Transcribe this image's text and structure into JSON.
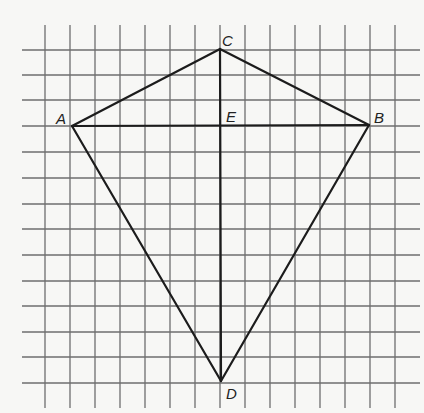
{
  "figure": {
    "colors": {
      "background": "#f7f7f5",
      "grid": "#6e6e6e",
      "lines": "#1c1c1c"
    },
    "grid": {
      "vertical_x": [
        45,
        70,
        95,
        120,
        145,
        170,
        195,
        220,
        245,
        270,
        295,
        320,
        345,
        370,
        395
      ],
      "vertical_y_range": [
        25,
        408
      ],
      "horizontal_y": [
        50,
        75,
        100,
        126,
        152,
        178,
        204,
        229,
        255,
        281,
        306,
        332,
        357,
        383
      ],
      "horizontal_x_range": [
        22,
        420
      ]
    },
    "points": {
      "A": {
        "x": 72,
        "y": 126,
        "label": "A"
      },
      "B": {
        "x": 369,
        "y": 125,
        "label": "B"
      },
      "C": {
        "x": 220,
        "y": 49,
        "label": "C"
      },
      "D": {
        "x": 221,
        "y": 381,
        "label": "D"
      },
      "E": {
        "x": 220,
        "y": 126,
        "label": "E"
      }
    },
    "segments": [
      [
        "A",
        "C"
      ],
      [
        "C",
        "B"
      ],
      [
        "B",
        "D"
      ],
      [
        "D",
        "A"
      ],
      [
        "A",
        "B"
      ],
      [
        "C",
        "D"
      ]
    ],
    "labels": {
      "A": {
        "text": "A",
        "x": 56,
        "y": 124
      },
      "B": {
        "text": "B",
        "x": 374,
        "y": 123
      },
      "C": {
        "text": "C",
        "x": 222,
        "y": 46
      },
      "D": {
        "text": "D",
        "x": 226,
        "y": 399
      },
      "E": {
        "text": "E",
        "x": 226,
        "y": 122
      }
    }
  }
}
